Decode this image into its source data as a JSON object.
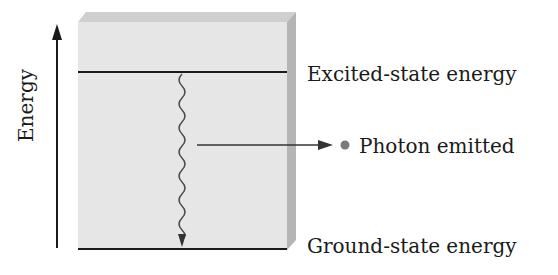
{
  "diagram": {
    "type": "energy-level-diagram",
    "axis": {
      "label": "Energy",
      "direction": "up"
    },
    "levels": [
      {
        "name": "excited",
        "label": "Excited-state energy"
      },
      {
        "name": "ground",
        "label": "Ground-state energy"
      }
    ],
    "transition": {
      "from": "excited",
      "to": "ground",
      "style": "wavy-arrow-down"
    },
    "emission": {
      "label": "Photon emitted",
      "marker": "dot"
    },
    "colors": {
      "box_face": "#e6e6e6",
      "box_top": "#cfcfcf",
      "box_side": "#b5b5b5",
      "lines": "#1a1a1a",
      "photon_dot": "#7a7a7a",
      "wavy": "#4a4a4a"
    }
  }
}
